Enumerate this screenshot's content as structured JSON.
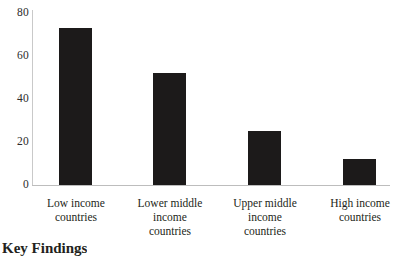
{
  "chart_data": {
    "type": "bar",
    "title": "",
    "subtitle": "",
    "xlabel": "",
    "ylabel": "",
    "ylim": [
      0,
      80
    ],
    "grid": false,
    "legend": false,
    "bar_color": "#1c1a1a",
    "axis_color": "#c2c2c2",
    "categories": [
      "Low income\ncountries",
      "Lower middle\nincome\ncountries",
      "Upper middle\nincome\ncountries",
      "High income\ncountries"
    ],
    "values": [
      73,
      52,
      25,
      12
    ],
    "yticks": [
      "0",
      "20",
      "40",
      "60",
      "80"
    ],
    "ytick_values": [
      0,
      20,
      40,
      60,
      80
    ]
  },
  "page": {
    "heading": "Key Findings"
  }
}
